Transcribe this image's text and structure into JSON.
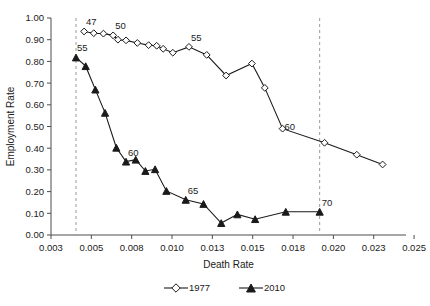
{
  "chart_data": {
    "type": "line",
    "title": "",
    "xlabel": "Death Rate",
    "ylabel": "Employment Rate",
    "xlim": [
      0.003,
      0.025
    ],
    "ylim": [
      0.0,
      1.0
    ],
    "xticks": [
      "0.003",
      "0.005",
      "0.008",
      "0.010",
      "0.013",
      "0.015",
      "0.018",
      "0.020",
      "0.023",
      "0.025"
    ],
    "xtick_values": [
      0.003,
      0.0055,
      0.008,
      0.0105,
      0.013,
      0.0155,
      0.018,
      0.0205,
      0.023,
      0.0255
    ],
    "yticks": [
      "0.00",
      "0.10",
      "0.20",
      "0.30",
      "0.40",
      "0.50",
      "0.60",
      "0.70",
      "0.80",
      "0.90",
      "1.00"
    ],
    "ytick_values": [
      0.0,
      0.1,
      0.2,
      0.3,
      0.4,
      0.5,
      0.6,
      0.7,
      0.8,
      0.9,
      1.0
    ],
    "grid": false,
    "legend_position": "bottom",
    "reference_lines": [
      {
        "name": "age-47-line",
        "x": 0.00455,
        "style": "dashed"
      },
      {
        "name": "age-70-line",
        "x": 0.01965,
        "style": "dashed"
      }
    ],
    "series": [
      {
        "name": "1977",
        "marker": "open-diamond",
        "x": [
          0.00505,
          0.00565,
          0.00625,
          0.00685,
          0.00715,
          0.00765,
          0.00835,
          0.00905,
          0.00955,
          0.00995,
          0.01055,
          0.01155,
          0.01265,
          0.01385,
          0.01545,
          0.01625,
          0.01735,
          0.01995,
          0.02195,
          0.02355
        ],
        "y": [
          0.938,
          0.93,
          0.928,
          0.92,
          0.9,
          0.897,
          0.885,
          0.875,
          0.872,
          0.858,
          0.84,
          0.867,
          0.83,
          0.735,
          0.79,
          0.678,
          0.49,
          0.425,
          0.37,
          0.325
        ]
      },
      {
        "name": "2010",
        "marker": "filled-triangle",
        "x": [
          0.00455,
          0.00515,
          0.00575,
          0.00635,
          0.00705,
          0.00765,
          0.00825,
          0.00885,
          0.00945,
          0.01015,
          0.01135,
          0.01245,
          0.01355,
          0.01455,
          0.01565,
          0.01755,
          0.01965
        ],
        "y": [
          0.818,
          0.778,
          0.67,
          0.563,
          0.402,
          0.338,
          0.347,
          0.295,
          0.303,
          0.203,
          0.162,
          0.143,
          0.055,
          0.095,
          0.073,
          0.107,
          0.107
        ]
      }
    ],
    "annotations": [
      {
        "text": "47",
        "series": "1977",
        "x": 0.00505,
        "y": 0.938
      },
      {
        "text": "50",
        "series": "1977",
        "x": 0.00685,
        "y": 0.92
      },
      {
        "text": "55",
        "series": "1977",
        "x": 0.01155,
        "y": 0.867
      },
      {
        "text": "60",
        "series": "1977",
        "x": 0.01735,
        "y": 0.49
      },
      {
        "text": "55",
        "series": "2010",
        "x": 0.00455,
        "y": 0.818
      },
      {
        "text": "60",
        "series": "2010",
        "x": 0.00765,
        "y": 0.338
      },
      {
        "text": "65",
        "series": "2010",
        "x": 0.01135,
        "y": 0.162
      },
      {
        "text": "70",
        "series": "2010",
        "x": 0.01965,
        "y": 0.107
      }
    ],
    "legend": [
      {
        "label": "1977",
        "marker": "open-diamond"
      },
      {
        "label": "2010",
        "marker": "filled-triangle"
      }
    ],
    "colors": {
      "line": "#1a1a1a",
      "axis": "#4d4d4d",
      "reference": "#9a9a9a",
      "marker_fill": "#ffffff"
    }
  }
}
